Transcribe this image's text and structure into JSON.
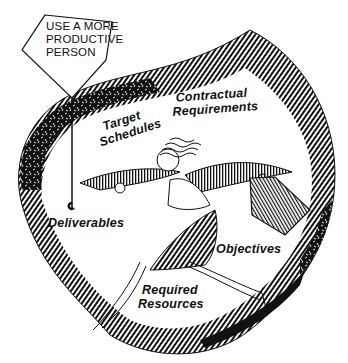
{
  "sign": {
    "lines": [
      "USE A MORE",
      "PRODUCTIVE",
      "PERSON"
    ]
  },
  "labels": {
    "target_schedules": [
      "Target",
      "Schedules"
    ],
    "contractual_requirements": [
      "Contractual",
      "Requirements"
    ],
    "deliverables": "Deliverables",
    "objectives": "Objectives",
    "required_resources": [
      "Required",
      "Resources"
    ]
  },
  "colors": {
    "ink": "#111111",
    "paper": "#ffffff"
  }
}
